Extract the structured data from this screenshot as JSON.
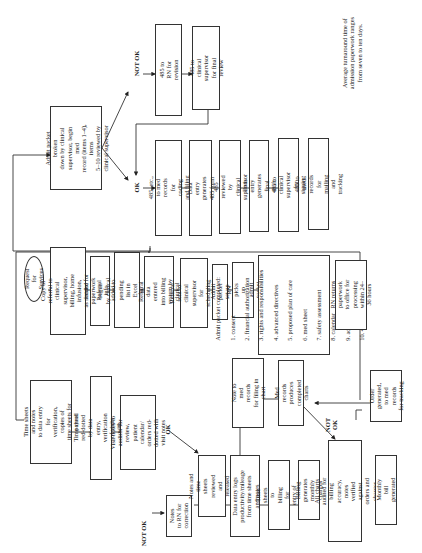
{
  "diagram": {
    "orientation": "rotated-90-ccw",
    "start": {
      "label": "Request for Services"
    },
    "referral_column": [
      "Copy of referral to\nclinical supervisor,\nbilling, home infusion,\nas needed for review",
      "Intake paperwork begun\nby clerical or RN",
      "Referral info added to\npending list in Excel\nby clerical or RN",
      "Referral data entered\ninto billing system by\nclerical",
      "Referral sent to clinical\nsupervisor for scheduling\nin Excel",
      "Admit packet set up",
      "RN picks up admit\npacket"
    ],
    "admit_packet": {
      "title": "Admit packet completed:",
      "items": [
        "1. consent",
        "2. financial authorization",
        "3. rights and responsibilities",
        "4. advanced directives",
        "5. proposed plan of care",
        "6. med sheet",
        "7. safety assessment",
        "8. calendar",
        "9. admission assessment",
        "10. 485 worksheet"
      ]
    },
    "rn_returns": "RN returns paperwork\nto office for processing\nwithin 24–36 hours",
    "admit_breakdown": "Admit packet broken\ndown by clinical\nsupervisor, begin med\nrecord (items 1–4), items\n5–10 reviewed by\nclinical supervisor",
    "decision_labels": {
      "ok": "OK",
      "not_ok": "NOT OK"
    },
    "not_ok_path": [
      "485 to\nRN for revision",
      "485 to\nclinical supervisor\nfor final review"
    ],
    "ok_path": [
      "485, etc., to med\nrecords for coding and filing",
      "Data entry generates\n485 form",
      "485 reviewed by\nclinical supervisor",
      "Data entry generates\nfinal draft",
      "485 to clinical supervisor\nfor signing",
      "485 to med records\nfor mailing and tracking"
    ],
    "turnaround_note": "Average turnaround time of\nadmission paperwork ranges\nfrom seven to ten days.",
    "visit_column": [
      "Time sheets and notes\nto data entry for\nverification, copies of\ntime sheets for payroll",
      "Time sheet red-dotted by data entry,\nverification of visits with schedule",
      "Visit notes to auditor for\nreview, patient calendar/\norders red-dotted with\nvisit notes"
    ],
    "correction": {
      "not_ok_label": "NOT OK",
      "ok_label": "OK",
      "notes_to_rn": "Notes\nto RN for correction"
    },
    "billing_column": [
      "Notes and time\nsheets reviewed and\nreleased by author",
      "Data entry logs\nproductivity/mileage\nfrom time sheets and notes",
      "Time sheets to billing\nfor entry of charges",
      "Billing generates\nmonthly charges",
      "All charts audited for billing\naccuracy, notes verified against\norders and charges",
      "Monthly bill generated"
    ],
    "records_column": [
      "Note to med records\nfor filing in chart",
      "Med records produces\ncompleted charts"
    ],
    "order_generated": "Order generated,\nto med records\nfor tracking",
    "audit_labels": {
      "not_ok": "NOT\nOK"
    }
  }
}
